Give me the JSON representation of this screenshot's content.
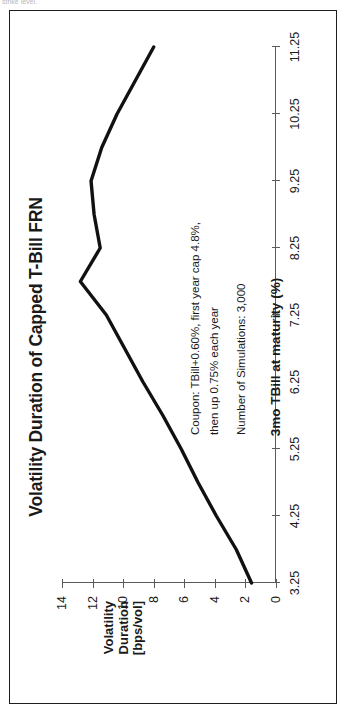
{
  "figure": {
    "scan_artifact_text": "strike level.",
    "title": "Volatility Duration of Capped T-Bill FRN"
  },
  "annotation": {
    "line1": "Coupon: TBill+0.60%, first year cap 4.8%,",
    "line2": "then up 0.75% each year",
    "line3": "Number of Simulations: 3,000"
  },
  "axes": {
    "x_title": "3mo TBill at maturity (%)",
    "y_title_line1": "Volatility",
    "y_title_line2": "Duration",
    "y_title_line3": "[bps/vol]"
  },
  "chart_data": {
    "type": "line",
    "title": "Volatility Duration of Capped T-Bill FRN",
    "xlabel": "3mo TBill at maturity (%)",
    "ylabel": "Volatility Duration [bps/vol]",
    "xlim": [
      3.25,
      11.25
    ],
    "ylim": [
      0,
      14
    ],
    "xticks": [
      3.25,
      4.25,
      5.25,
      6.25,
      7.25,
      8.25,
      9.25,
      10.25,
      11.25
    ],
    "xtick_labels": [
      "3.25",
      "4.25",
      "5.25",
      "6.25",
      "7.25",
      "8.25",
      "9.25",
      "10.25",
      "11.25"
    ],
    "yticks": [
      0,
      2,
      4,
      6,
      8,
      10,
      12,
      14
    ],
    "ytick_labels": [
      "0",
      "2",
      "4",
      "6",
      "8",
      "10",
      "12",
      "14"
    ],
    "grid": false,
    "legend": false,
    "line_color": "#111111",
    "line_width_px": 3.4,
    "series": [
      {
        "name": "Volatility Duration",
        "x": [
          3.25,
          3.75,
          4.25,
          4.75,
          5.25,
          5.75,
          6.25,
          6.75,
          7.25,
          7.75,
          8.25,
          8.75,
          9.25,
          9.75,
          10.25,
          10.75,
          11.25
        ],
        "values": [
          1.6,
          2.6,
          3.9,
          5.1,
          6.2,
          7.4,
          8.7,
          9.9,
          11.1,
          12.8,
          11.5,
          11.9,
          12.1,
          11.4,
          10.4,
          9.2,
          8.0
        ]
      }
    ]
  }
}
